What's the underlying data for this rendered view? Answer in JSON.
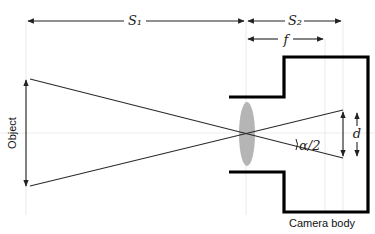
{
  "diagram": {
    "type": "optics-camera-lens",
    "labels": {
      "object_distance": "S₁",
      "image_distance": "S₂",
      "focal_length": "f",
      "image_size": "d",
      "half_angle": "α/2",
      "object": "Object",
      "camera_body": "Camera body"
    },
    "colors": {
      "lines": "#222222",
      "camera_body": "#000000",
      "lens": "#b5b5b5",
      "guides": "#e4e4e4"
    }
  }
}
